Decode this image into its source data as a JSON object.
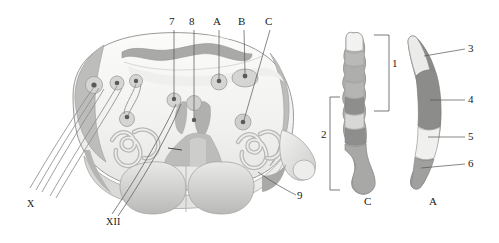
{
  "figure": {
    "canvas": {
      "width": 499,
      "height": 243
    },
    "background_color": "#ffffff"
  },
  "palette": {
    "outline": "#8a8a8a",
    "outline_dark": "#6f6f6f",
    "parenchyma_light": "#f1f1f0",
    "parenchyma_lighter": "#f7f7f6",
    "gray_pale": "#e3e3e1",
    "gray_mid": "#c9c9c7",
    "gray_medium": "#b4b4b2",
    "gray_dark": "#9a9a98",
    "gray_darker": "#848482",
    "nucleus_fill": "#d3d3d1",
    "nucleus_dot": "#5a5a58",
    "fiber_line": "#9d9d9b",
    "leader_line": "#555555",
    "text": "#1a1a1a"
  },
  "cross_section": {
    "name": "medulla-oblongata-cross-section",
    "description": "Transverse section of medulla showing cranial nerve nuclei, inferior olivary nuclei and pyramids"
  },
  "labels": {
    "top": [
      {
        "id": "label-7",
        "text": "7",
        "x": 171,
        "y": 22,
        "leader_x": 174,
        "leader_y1": 30,
        "leader_y2": 98
      },
      {
        "id": "label-8",
        "text": "8",
        "x": 191,
        "y": 22,
        "leader_x": 194,
        "leader_y1": 30,
        "leader_y2": 120
      },
      {
        "id": "label-A-top",
        "text": "A",
        "x": 215,
        "y": 22,
        "leader_x": 219,
        "leader_y1": 30,
        "leader_y2": 80
      },
      {
        "id": "label-B-top",
        "text": "B",
        "x": 240,
        "y": 22,
        "leader_x": 244,
        "leader_y1": 30,
        "leader_y2": 74
      },
      {
        "id": "label-C-top",
        "text": "C",
        "x": 267,
        "y": 22,
        "leader_x": 270,
        "leader_y1": 30,
        "leader_y2": 120
      }
    ],
    "right_column_A": [
      {
        "id": "label-3",
        "text": "3",
        "x": 470,
        "y": 45,
        "leader_x1": 447,
        "leader_x2": 465,
        "leader_y": 49
      },
      {
        "id": "label-4",
        "text": "4",
        "x": 470,
        "y": 96,
        "leader_x1": 441,
        "leader_x2": 465,
        "leader_y": 100
      },
      {
        "id": "label-5",
        "text": "5",
        "x": 470,
        "y": 133,
        "leader_x1": 441,
        "leader_x2": 465,
        "leader_y": 137
      },
      {
        "id": "label-6",
        "text": "6",
        "x": 470,
        "y": 160,
        "leader_x1": 437,
        "leader_x2": 465,
        "leader_y": 164
      }
    ],
    "brackets": [
      {
        "id": "bracket-1",
        "text": "1",
        "x": 383,
        "y": 63
      },
      {
        "id": "bracket-2",
        "text": "2",
        "x": 323,
        "y": 134
      }
    ],
    "lower": [
      {
        "id": "label-9",
        "text": "9",
        "x": 299,
        "y": 192
      },
      {
        "id": "label-X",
        "text": "X",
        "x": 29,
        "y": 200
      },
      {
        "id": "label-XII",
        "text": "XII",
        "x": 108,
        "y": 218
      }
    ],
    "captions": [
      {
        "id": "caption-C",
        "text": "C",
        "x": 366,
        "y": 200
      },
      {
        "id": "caption-A",
        "text": "A",
        "x": 431,
        "y": 200
      }
    ]
  },
  "column_C": {
    "name": "nucleus-column-C",
    "caption": "C",
    "segments": [
      {
        "index": 0,
        "shade": "#f0f0ee"
      },
      {
        "index": 1,
        "shade": "#b9b9b7"
      },
      {
        "index": 2,
        "shade": "#aeaeac"
      },
      {
        "index": 3,
        "shade": "#b5b5b3"
      },
      {
        "index": 4,
        "shade": "#8e8e8c"
      },
      {
        "index": 5,
        "shade": "#d8d8d6"
      },
      {
        "index": 6,
        "shade": "#8e8e8c"
      },
      {
        "index": 7,
        "shade": "#a8a8a6"
      }
    ]
  },
  "column_A": {
    "name": "nucleus-column-A",
    "caption": "A",
    "segments": [
      {
        "index": 0,
        "shade": "#ebebe9",
        "label_ref": "3"
      },
      {
        "index": 1,
        "shade": "#8c8c8a",
        "label_ref": "4"
      },
      {
        "index": 2,
        "shade": "#f0f0ee",
        "label_ref": "5"
      },
      {
        "index": 3,
        "shade": "#a0a09e",
        "label_ref": "6"
      }
    ]
  },
  "nuclei": [
    {
      "id": "nucleus-left-1",
      "cx": 94,
      "cy": 85,
      "r": 8.5
    },
    {
      "id": "nucleus-left-2",
      "cx": 117,
      "cy": 83,
      "r": 7.0
    },
    {
      "id": "nucleus-left-3",
      "cx": 136,
      "cy": 81,
      "r": 6.5
    },
    {
      "id": "nucleus-left-4",
      "cx": 127,
      "cy": 119,
      "r": 7.5
    },
    {
      "id": "nucleus-mid-7",
      "cx": 174,
      "cy": 100,
      "r": 7.0
    },
    {
      "id": "nucleus-mid-8",
      "cx": 194,
      "cy": 103,
      "r": 7.5
    },
    {
      "id": "nucleus-A",
      "cx": 219,
      "cy": 82,
      "r": 8.0
    },
    {
      "id": "nucleus-B",
      "cx": 245,
      "cy": 78,
      "r": 11.0
    },
    {
      "id": "nucleus-C",
      "cx": 243,
      "cy": 122,
      "r": 8.0
    }
  ],
  "nerve_groups": [
    {
      "id": "vagus-rootlets-X",
      "label": "X",
      "count": 5
    },
    {
      "id": "hypoglossal-rootlets-XII",
      "label": "XII",
      "count": 2
    }
  ]
}
